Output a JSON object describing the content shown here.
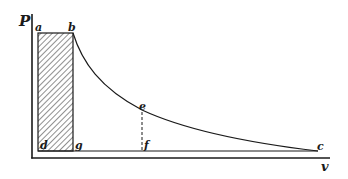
{
  "diagram": {
    "type": "pv-diagram",
    "axes": {
      "y_label": "P",
      "x_label": "v"
    },
    "points": {
      "a": "a",
      "b": "b",
      "c": "c",
      "d": "d",
      "e": "e",
      "f": "f",
      "g": "g"
    },
    "regions": [
      {
        "name": "shaded-rectangle",
        "corners": [
          "a",
          "b",
          "g",
          "d"
        ],
        "fill": "hatched"
      }
    ],
    "curves": [
      {
        "name": "expansion-curve",
        "from": "b",
        "through": "e",
        "to": "c"
      }
    ],
    "lines": [
      {
        "name": "ordinate-ef",
        "from": "e",
        "to": "f",
        "style": "dashed"
      }
    ],
    "colors": {
      "ink": "#1a1a1a",
      "background": "#ffffff"
    }
  }
}
